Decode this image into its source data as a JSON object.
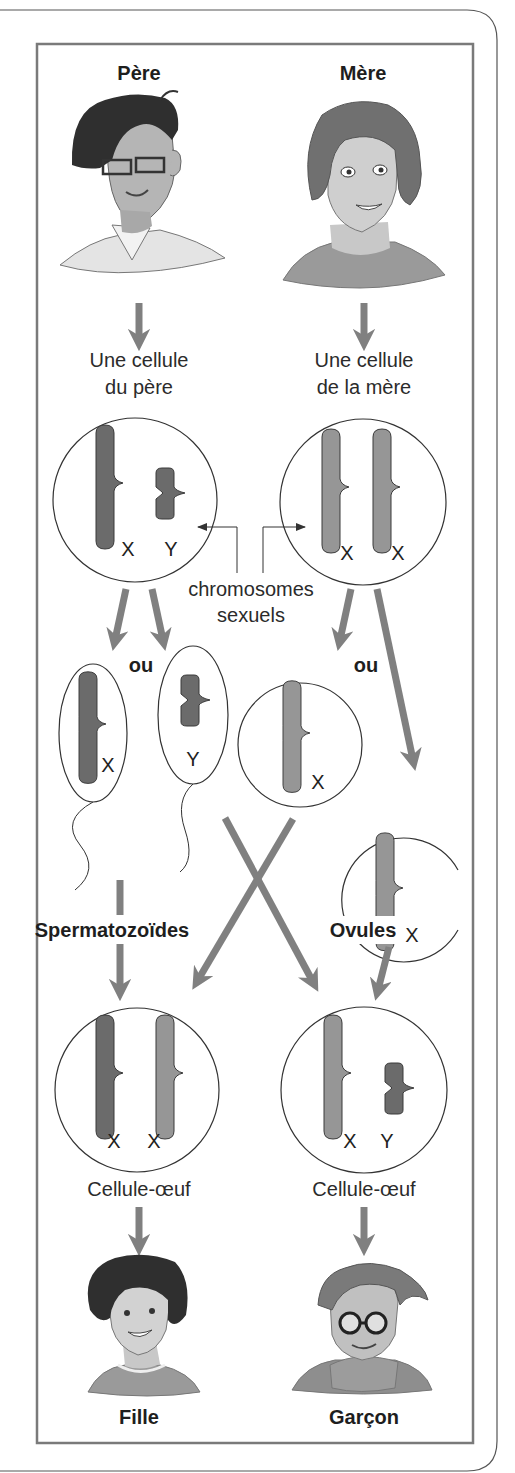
{
  "labels": {
    "father": "Père",
    "mother": "Mère",
    "father_cell": [
      "Une cellule",
      "du père"
    ],
    "mother_cell": [
      "Une cellule",
      "de la mère"
    ],
    "sex_chromosomes": [
      "chromosomes",
      "sexuels"
    ],
    "or": "ou",
    "sperm": "Spermatozoïdes",
    "ova": "Ovules",
    "zygote": "Cellule-œuf",
    "girl": "Fille",
    "boy": "Garçon"
  },
  "chromosomes": {
    "x": "X",
    "y": "Y"
  },
  "cells": {
    "father_cell": [
      "X",
      "Y"
    ],
    "mother_cell": [
      "X",
      "X"
    ],
    "sperm_1": [
      "X"
    ],
    "sperm_2": [
      "Y"
    ],
    "ovum_1": [
      "X"
    ],
    "ovum_2": [
      "X"
    ],
    "zygote_girl": [
      "X",
      "X"
    ],
    "zygote_boy": [
      "X",
      "Y"
    ]
  },
  "colors": {
    "arrow": "#808080",
    "father_chromosome": "#6b6b6b",
    "mother_chromosome": "#969696",
    "outline": "#3a3a3a",
    "frame": "#777777"
  }
}
